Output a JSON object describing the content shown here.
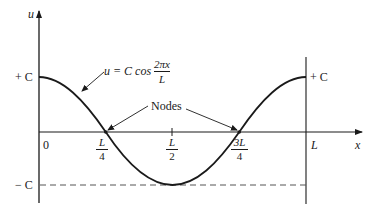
{
  "diagram": {
    "type": "standing-wave-mode-shape",
    "colors": {
      "ink": "#1a1a1a",
      "dashed": "#555555",
      "background": "#ffffff"
    },
    "axes": {
      "y_label": "u",
      "x_label": "x",
      "y_ticks": {
        "top": "+ C",
        "bottom": "− C"
      },
      "right_boundary_label": "+ C",
      "origin_label": "0",
      "x_end_label": "L"
    },
    "x_ticks": [
      {
        "num": "L",
        "den": "4"
      },
      {
        "num": "L",
        "den": "2"
      },
      {
        "num": "3L",
        "den": "4"
      }
    ],
    "curve_equation": {
      "lhs": "u = C cos",
      "frac_num": "2πx",
      "frac_den": "L"
    },
    "annotation": {
      "label": "Nodes"
    }
  }
}
